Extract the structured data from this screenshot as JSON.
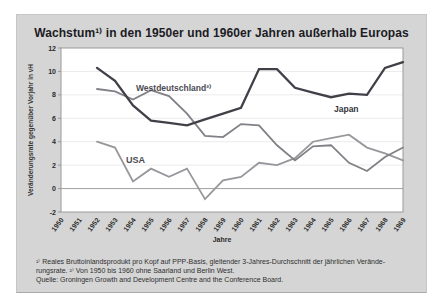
{
  "figure": {
    "title": "Wachstum¹⁾ in den 1950er und 1960er Jahren außerhalb Europas",
    "footnote_line1": "¹⁾ Reales Bruttoinlandsprodukt pro Kopf auf PPP-Basis, gleitender 3-Jahres-Durchschnitt der jährlichen Verände-",
    "footnote_line2": "rungsrate.  ²⁾ Von 1950 bis 1960 ohne Saarland und Berlin West.",
    "footnote_line3": "Quelle: Groningen Growth and Development Centre and the Conference Board.",
    "panel_background": "#d5d5d5",
    "plot_background": "#ffffff"
  },
  "chart_data": {
    "type": "line",
    "title": "Wachstum¹⁾ in den 1950er und 1960er Jahren außerhalb Europas",
    "xlabel": "Jahre",
    "ylabel": "Veränderungsrate gegenüber Vorjahr in vH",
    "x_ticks": [
      1950,
      1951,
      1952,
      1953,
      1954,
      1955,
      1956,
      1957,
      1958,
      1959,
      1960,
      1961,
      1962,
      1963,
      1964,
      1965,
      1966,
      1967,
      1968,
      1969
    ],
    "y_ticks": [
      12,
      10,
      8,
      6,
      4,
      2,
      0,
      -2
    ],
    "ylim": [
      -2,
      12
    ],
    "xlim": [
      1950,
      1969
    ],
    "grid": "horizontal-light",
    "zero_line": true,
    "legend_position": "inline-labels",
    "x": [
      1952,
      1953,
      1954,
      1955,
      1956,
      1957,
      1958,
      1959,
      1960,
      1961,
      1962,
      1963,
      1964,
      1965,
      1966,
      1967,
      1968,
      1969
    ],
    "series": [
      {
        "name": "Japan",
        "color": "#404048",
        "stroke_width": 2.3,
        "values": [
          10.3,
          9.2,
          7.1,
          5.8,
          5.6,
          5.4,
          5.9,
          6.4,
          6.9,
          10.2,
          10.2,
          8.6,
          8.2,
          7.8,
          8.1,
          8.0,
          10.3,
          10.8
        ]
      },
      {
        "name": "Westdeutschland²⁾",
        "color": "#808086",
        "stroke_width": 1.8,
        "values": [
          8.5,
          8.3,
          7.6,
          8.4,
          7.9,
          6.4,
          4.5,
          4.4,
          5.5,
          5.4,
          3.7,
          2.4,
          3.6,
          3.7,
          2.2,
          1.5,
          2.7,
          3.5
        ]
      },
      {
        "name": "USA",
        "color": "#97979c",
        "stroke_width": 1.8,
        "values": [
          4.0,
          3.5,
          0.6,
          1.7,
          1.0,
          1.7,
          -0.9,
          0.7,
          1.0,
          2.2,
          2.0,
          2.6,
          4.0,
          4.3,
          4.6,
          3.5,
          3.0,
          2.4
        ]
      }
    ],
    "axis_colors": {
      "plot_border": "#9a9a9a",
      "gridline": "#ebebeb",
      "zero_line": "#a0a0a0",
      "tick_text": "#2b2b2b"
    }
  }
}
